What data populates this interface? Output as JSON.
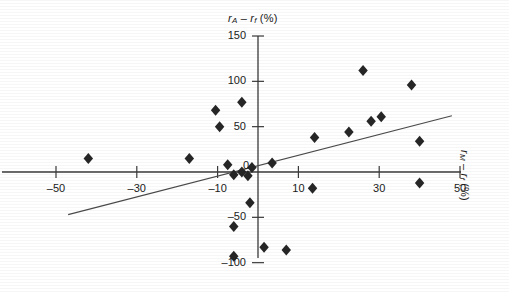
{
  "chart_data": {
    "type": "scatter",
    "title": "",
    "ylabel": "rA - rf (%)",
    "xlabel": "rM - rf (%)",
    "xlim": [
      -58,
      52
    ],
    "ylim": [
      -112,
      152
    ],
    "grid": false,
    "legend": null,
    "xticks": [
      -50,
      -30,
      -10,
      10,
      30,
      50
    ],
    "xtick_labels": [
      "–50",
      "–30",
      "–10",
      "10",
      "30",
      "50"
    ],
    "yticks": [
      150,
      100,
      50,
      0,
      -50,
      -100
    ],
    "ytick_labels": [
      "150",
      "100",
      "50",
      "0",
      "–50",
      "–100"
    ],
    "points": [
      {
        "x": -42.0,
        "y": 15.0
      },
      {
        "x": -17.0,
        "y": 15.0
      },
      {
        "x": -7.5,
        "y": 8.0
      },
      {
        "x": -6.0,
        "y": -3.0
      },
      {
        "x": -4.0,
        "y": 0.0
      },
      {
        "x": -2.5,
        "y": -4.0
      },
      {
        "x": -1.5,
        "y": 5.0
      },
      {
        "x": -10.5,
        "y": 68.0
      },
      {
        "x": -9.5,
        "y": 50.0
      },
      {
        "x": -4.0,
        "y": 77.0
      },
      {
        "x": -2.0,
        "y": -34.0
      },
      {
        "x": -6.0,
        "y": -60.0
      },
      {
        "x": -6.0,
        "y": -93.0
      },
      {
        "x": 1.5,
        "y": -83.0
      },
      {
        "x": 7.0,
        "y": -86.0
      },
      {
        "x": 3.5,
        "y": 10.0
      },
      {
        "x": 13.5,
        "y": -18.0
      },
      {
        "x": 14.0,
        "y": 38.0
      },
      {
        "x": 22.5,
        "y": 44.0
      },
      {
        "x": 26.0,
        "y": 112.0
      },
      {
        "x": 28.0,
        "y": 56.0
      },
      {
        "x": 30.5,
        "y": 61.0
      },
      {
        "x": 38.0,
        "y": 96.0
      },
      {
        "x": 40.0,
        "y": 34.0
      },
      {
        "x": 40.0,
        "y": -12.0
      }
    ],
    "fit_line": {
      "label": "regression line",
      "x_start": -47.0,
      "y_start": -47.0,
      "x_end": 48.0,
      "y_end": 62.0
    },
    "marker": {
      "shape": "diamond",
      "color": "#262626",
      "size": 11
    }
  }
}
